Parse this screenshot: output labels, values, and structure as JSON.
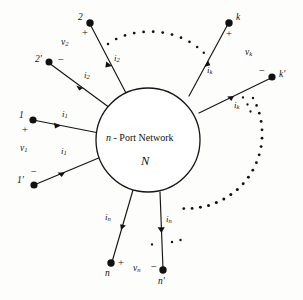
{
  "figure": {
    "kind": "circuit-diagram",
    "title_center_prefix": "n",
    "title_center_rest": " - Port Network",
    "center_symbol": "ℕ",
    "center_symbol_plain": "N",
    "background_color": "#fdfdfc",
    "line_color": "#151515"
  },
  "ports": [
    {
      "id": "port-1",
      "top_node_label": "1",
      "bottom_node_label": "1'",
      "plus_sign": "+",
      "minus_sign": "−",
      "voltage_label": "v",
      "voltage_sub": "1",
      "current_label_top": "i",
      "current_sub_top": "1",
      "current_label_bottom": "i",
      "current_sub_bottom": "1"
    },
    {
      "id": "port-2",
      "top_node_label": "2",
      "bottom_node_label": "2'",
      "plus_sign": "+",
      "minus_sign": "−",
      "voltage_label": "v",
      "voltage_sub": "2",
      "current_label_top": "i",
      "current_sub_top": "2",
      "current_label_bottom": "i",
      "current_sub_bottom": "2"
    },
    {
      "id": "port-k",
      "top_node_label": "k",
      "bottom_node_label": "k'",
      "plus_sign": "+",
      "minus_sign": "−",
      "voltage_label": "v",
      "voltage_sub": "k",
      "current_label_top": "i",
      "current_sub_top": "k",
      "current_label_bottom": "i",
      "current_sub_bottom": "k"
    },
    {
      "id": "port-n",
      "top_node_label": "n",
      "bottom_node_label": "n'",
      "plus_sign": "+",
      "minus_sign": "−",
      "voltage_label": "v",
      "voltage_sub": "n",
      "current_label_top": "i",
      "current_sub_top": "n",
      "current_label_bottom": "i",
      "current_sub_bottom": "n"
    }
  ],
  "ellipses": [
    {
      "id": "top-ellipsis",
      "description": "dotted arc between port 2 and port k"
    },
    {
      "id": "right-ellipsis",
      "description": "dotted arc between port k' and port n'"
    }
  ],
  "geometry": {
    "circle_cx": 148,
    "circle_cy": 140,
    "circle_r": 52
  }
}
